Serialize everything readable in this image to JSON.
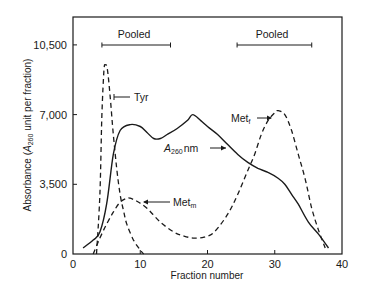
{
  "chart_data": {
    "type": "line",
    "title": "",
    "xlabel": "Fraction number",
    "ylabel": "Absorbance (A260 unit per fraction)",
    "ylabel_parts": {
      "prefix": "Absorbance (",
      "italic": "A",
      "sub": "260",
      "suffix": " unit per fraction)"
    },
    "xlim": [
      0,
      40
    ],
    "ylim": [
      0,
      12000
    ],
    "x_ticks": [
      0,
      10,
      20,
      30,
      40
    ],
    "x_tick_labels": [
      "0",
      "10",
      "20",
      "30",
      "40"
    ],
    "y_ticks": [
      0,
      3500,
      7000,
      10500
    ],
    "y_tick_labels": [
      "0",
      "3,500",
      "7,000",
      "10,500"
    ],
    "grid": false,
    "legend": "none (curves labeled inline)",
    "series": [
      {
        "name": "A260 nm",
        "label_parts": {
          "italic": "A",
          "sub": "260",
          "suffix": " nm"
        },
        "style": "solid",
        "x": [
          1.5,
          3,
          4,
          5,
          6,
          7,
          8.5,
          10,
          11,
          12,
          13,
          14,
          15.5,
          17,
          17.8,
          19,
          20,
          21.5,
          23,
          24.5,
          26,
          27.5,
          29,
          30.5,
          31.5,
          32.5,
          33.5,
          35,
          36.5,
          38
        ],
        "y": [
          300,
          700,
          1100,
          2500,
          5000,
          6200,
          6500,
          6400,
          6100,
          5800,
          5800,
          6000,
          6300,
          6700,
          7000,
          6700,
          6400,
          6000,
          5500,
          5000,
          4600,
          4300,
          4100,
          3800,
          3500,
          3000,
          2500,
          1600,
          1000,
          300
        ]
      },
      {
        "name": "Tyr",
        "style": "dashed",
        "x": [
          3.5,
          4,
          4.3,
          4.6,
          4.8,
          5.1,
          5.5,
          6,
          6.5,
          7,
          7.5,
          8,
          9,
          10,
          10.5
        ],
        "y": [
          0,
          3000,
          7000,
          9200,
          9500,
          9300,
          8000,
          6000,
          4300,
          3000,
          2200,
          1500,
          700,
          200,
          0
        ]
      },
      {
        "name": "Met_m",
        "label_parts": {
          "main": "Met",
          "sub": "m"
        },
        "style": "dashed",
        "x": [
          3,
          4,
          5,
          6,
          7,
          8,
          8.5,
          9.5,
          11,
          13,
          15,
          16.5,
          18,
          19.5,
          21,
          23,
          24.5,
          26,
          27,
          28,
          29,
          30,
          30.5,
          31.5,
          32.5,
          33.5,
          34.5,
          35.5,
          36.5,
          37.5
        ],
        "y": [
          0,
          800,
          1500,
          2100,
          2600,
          2800,
          2800,
          2650,
          2300,
          1600,
          1100,
          900,
          800,
          850,
          1100,
          2000,
          3000,
          4200,
          5000,
          6000,
          6700,
          7100,
          7200,
          7000,
          6200,
          5000,
          3800,
          2300,
          1200,
          300
        ]
      }
    ],
    "annotations": [
      {
        "text": "Pooled",
        "type": "range-bar",
        "x_from": 4.3,
        "x_to": 14.5
      },
      {
        "text": "Pooled",
        "type": "range-bar",
        "x_from": 24.4,
        "x_to": 35.5
      },
      {
        "text": "Tyr",
        "arrow_to_series": "Tyr"
      },
      {
        "text": "A260 nm",
        "arrow_to_series": "A260 nm"
      },
      {
        "text": "Metf",
        "arrow_to_series": "Met_m (right peak, Met_f)"
      },
      {
        "text": "Metm",
        "arrow_to_series": "Met_m"
      }
    ]
  },
  "labels": {
    "pooled_left": "Pooled",
    "pooled_right": "Pooled",
    "tyr": "Tyr",
    "a260_A": "A",
    "a260_sub": "260",
    "a260_unit": "nm",
    "metf_main": "Met",
    "metf_sub": "f",
    "metm_main": "Met",
    "metm_sub": "m",
    "xlabel": "Fraction number",
    "ylabel_prefix": "Absorbance (",
    "ylabel_A": "A",
    "ylabel_sub": "260",
    "ylabel_suffix": " unit per fraction)"
  },
  "colors": {
    "ink": "#1a1a1a",
    "background": "#ffffff"
  }
}
